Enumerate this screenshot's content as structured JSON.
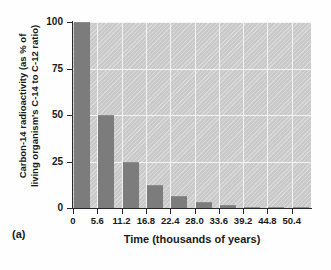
{
  "figure": {
    "caption": "(a)"
  },
  "chart_data": {
    "type": "bar",
    "title": "",
    "xlabel": "Time (thousands of years)",
    "ylabel_line1": "Carbon-14 radioactivity (as % of",
    "ylabel_line2": "living organism's C-14 to C-12 ratio)",
    "ylabel": "Carbon-14 radioactivity (as % of living organism's C-14 to C-12 ratio)",
    "categories": [
      "0",
      "5.6",
      "11.2",
      "16.8",
      "22.4",
      "28.0",
      "33.6",
      "39.2",
      "44.8",
      "50.4"
    ],
    "values": [
      100,
      50,
      25,
      12.5,
      6.25,
      3.1,
      1.6,
      0.8,
      0.4,
      0.2
    ],
    "yticks": [
      "0",
      "25",
      "50",
      "75",
      "100"
    ],
    "ytick_values": [
      0,
      25,
      50,
      75,
      100
    ],
    "ylim": [
      0,
      100
    ],
    "xlim": [
      0,
      58.8
    ],
    "grid": true,
    "legend": "none",
    "bar_color": "#7c7c7c",
    "panel_color": "#c9c9c9",
    "gridline_color": "#f2f2f2",
    "axis_color": "#2a2a2a"
  }
}
